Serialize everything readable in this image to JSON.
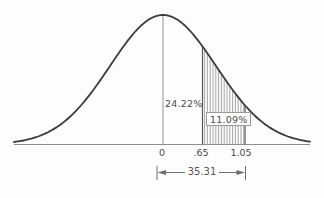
{
  "figure": {
    "background": "#fdfdfd",
    "curve_color": "#3c3c3c",
    "axis_color": "#8f8f8f",
    "hatch_color": "#8f8f8f",
    "boundary_color": "#555555",
    "mean_line_color": "#9c9c9c",
    "dimension_color": "#6e6e6e",
    "text_color": "#4a4a4a"
  },
  "chart_data": {
    "type": "area",
    "curve": "normal-distribution",
    "title": "",
    "xlabel": "",
    "ylabel": "",
    "x_ticks": [
      "0",
      ".65",
      "1.05"
    ],
    "grid": false,
    "legend": false,
    "regions": [
      {
        "from": "0",
        "to": ".65",
        "area_percent": 24.22,
        "label": "24.22%",
        "hatched": false
      },
      {
        "from": ".65",
        "to": "1.05",
        "area_percent": 11.09,
        "label": "11.09%",
        "hatched": true,
        "hatch_style": "vertical-lines"
      }
    ],
    "dimension": {
      "from": "0",
      "to": "1.05",
      "total_percent": 35.31,
      "label": "35.31"
    }
  }
}
